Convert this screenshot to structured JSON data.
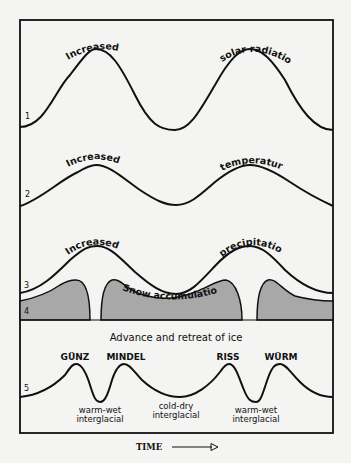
{
  "diagram": {
    "curves": [
      {
        "number": "1",
        "label_left": "Increased",
        "label_right": "solar radiation"
      },
      {
        "number": "2",
        "label_left": "Increased",
        "label_right": "temperature"
      },
      {
        "number": "3",
        "label_left": "Increased",
        "label_right": "precipitation"
      },
      {
        "number": "4",
        "label_center": "Snow accumulation"
      },
      {
        "number": "5",
        "title": "Advance and retreat of ice"
      }
    ],
    "glaciations": [
      "GÜNZ",
      "MINDEL",
      "RISS",
      "WÜRM"
    ],
    "interglacials": [
      {
        "line1": "warm-wet",
        "line2": "interglacial"
      },
      {
        "line1": "cold-dry",
        "line2": "interglacial"
      },
      {
        "line1": "warm-wet",
        "line2": "interglacial"
      }
    ],
    "axis_label": "TIME",
    "colors": {
      "background": "#f4f4f2",
      "line": "#111111",
      "snow_fill": "#a8a8a8"
    }
  }
}
